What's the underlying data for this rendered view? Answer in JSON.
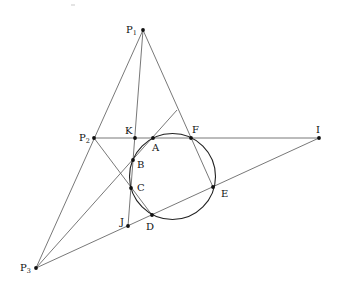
{
  "diagram": {
    "colors": {
      "line": "#555555",
      "circle": "#222222",
      "point": "#111111",
      "background": "#ffffff"
    },
    "circle": {
      "cx": 172.5,
      "cy": 176.5,
      "r": 43
    },
    "points": [
      {
        "id": "P1",
        "label": "P",
        "sub": "1",
        "x": 143,
        "y": 30,
        "lx": 126,
        "ly": 33
      },
      {
        "id": "P2",
        "label": "P",
        "sub": "2",
        "x": 94,
        "y": 138,
        "lx": 79,
        "ly": 141
      },
      {
        "id": "P3",
        "label": "P",
        "sub": "3",
        "x": 36,
        "y": 268,
        "lx": 20,
        "ly": 271
      },
      {
        "id": "K",
        "label": "K",
        "x": 135,
        "y": 138,
        "lx": 125,
        "ly": 134
      },
      {
        "id": "A",
        "label": "A",
        "x": 153,
        "y": 138,
        "lx": 152,
        "ly": 151
      },
      {
        "id": "F",
        "label": "F",
        "x": 191,
        "y": 138,
        "lx": 192,
        "ly": 133
      },
      {
        "id": "I",
        "label": "I",
        "x": 319,
        "y": 138,
        "lx": 316,
        "ly": 133
      },
      {
        "id": "B",
        "label": "B",
        "x": 133,
        "y": 160,
        "lx": 137,
        "ly": 168
      },
      {
        "id": "C",
        "label": "C",
        "x": 131,
        "y": 188,
        "lx": 137,
        "ly": 191
      },
      {
        "id": "E",
        "label": "E",
        "x": 213,
        "y": 187,
        "lx": 221,
        "ly": 197
      },
      {
        "id": "D",
        "label": "D",
        "x": 152,
        "y": 215,
        "lx": 146,
        "ly": 230
      },
      {
        "id": "J",
        "label": "J",
        "x": 128,
        "y": 226,
        "lx": 120,
        "ly": 225
      }
    ],
    "lines": [
      {
        "id": "P1-P3",
        "x1": 143,
        "y1": 30,
        "x2": 36,
        "y2": 268
      },
      {
        "id": "P1-E",
        "x1": 143,
        "y1": 30,
        "x2": 213,
        "y2": 187
      },
      {
        "id": "P1-J",
        "x1": 143,
        "y1": 30,
        "x2": 128,
        "y2": 226
      },
      {
        "id": "P2-I",
        "x1": 94,
        "y1": 138,
        "x2": 319,
        "y2": 138
      },
      {
        "id": "P2-D",
        "x1": 94,
        "y1": 138,
        "x2": 152,
        "y2": 215
      },
      {
        "id": "P3-I",
        "x1": 36,
        "y1": 268,
        "x2": 319,
        "y2": 138
      },
      {
        "id": "P3-BA",
        "x1": 36,
        "y1": 268,
        "x2": 177,
        "y2": 110
      }
    ]
  }
}
